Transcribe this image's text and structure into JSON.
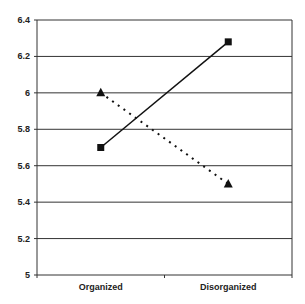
{
  "chart_data": {
    "type": "line",
    "title": "",
    "xlabel": "",
    "ylabel": "",
    "categories": [
      "Organized",
      "Disorganized"
    ],
    "series": [
      {
        "name": "Series 1 (square markers, solid line)",
        "marker": "square",
        "line": "solid",
        "values": [
          5.7,
          6.28
        ]
      },
      {
        "name": "Series 2 (triangle markers, dotted line)",
        "marker": "triangle",
        "line": "dotted",
        "values": [
          6.0,
          5.5
        ]
      }
    ],
    "ylim": [
      5,
      6.4
    ],
    "yticks": [
      "5",
      "5.2",
      "5.4",
      "5.6",
      "5.8",
      "6",
      "6.2",
      "6.4"
    ],
    "grid": true,
    "legend": "none"
  }
}
